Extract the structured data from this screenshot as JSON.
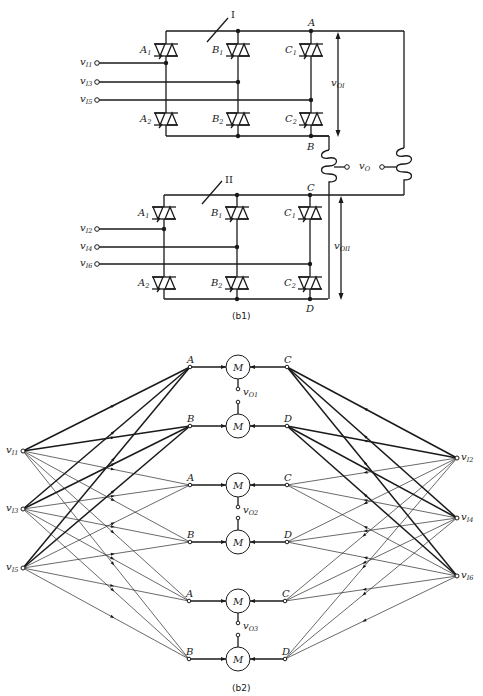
{
  "figure_b1": {
    "caption": "(b1)",
    "bridges": [
      {
        "id": "I",
        "label": "I",
        "thyristors": [
          "A1",
          "B1",
          "C1",
          "A2",
          "B2",
          "C2"
        ],
        "inputs": [
          "vI1",
          "vI3",
          "vI5"
        ],
        "top_node": "A",
        "bottom_node": "B",
        "output_label": "vOI"
      },
      {
        "id": "II",
        "label": "II",
        "thyristors": [
          "A1",
          "B1",
          "C1",
          "A2",
          "B2",
          "C2"
        ],
        "inputs": [
          "vI2",
          "vI4",
          "vI6"
        ],
        "top_node": "C",
        "bottom_node": "D",
        "output_label": "vOII"
      }
    ],
    "output_label": "vO"
  },
  "figure_b2": {
    "caption": "(b2)",
    "left_inputs": [
      "vI1",
      "vI3",
      "vI5"
    ],
    "right_inputs": [
      "vI2",
      "vI4",
      "vI6"
    ],
    "matrices": [
      {
        "left": "A",
        "right": "C",
        "node": "M"
      },
      {
        "left": "B",
        "right": "D",
        "node": "M"
      },
      {
        "left": "A",
        "right": "C",
        "node": "M"
      },
      {
        "left": "B",
        "right": "D",
        "node": "M"
      },
      {
        "left": "A",
        "right": "C",
        "node": "M"
      },
      {
        "left": "B",
        "right": "D",
        "node": "M"
      }
    ],
    "outputs": [
      "vO1",
      "vO2",
      "vO3"
    ]
  },
  "labels": {
    "I": "I",
    "II": "II",
    "A": "A",
    "B": "B",
    "C": "C",
    "D": "D",
    "M": "M",
    "v": "v",
    "sub_I1": "I1",
    "sub_I2": "I2",
    "sub_I3": "I3",
    "sub_I4": "I4",
    "sub_I5": "I5",
    "sub_I6": "I6",
    "sub_O1": "O1",
    "sub_O2": "O2",
    "sub_O3": "O3",
    "sub_OI": "OI",
    "sub_OII": "OII",
    "sub_O": "O",
    "A1": "A",
    "A2": "A",
    "B1": "B",
    "B2": "B",
    "C1": "C",
    "C2": "C",
    "one": "1",
    "two": "2",
    "cap_b1": "(b1)",
    "cap_b2": "(b2)"
  }
}
